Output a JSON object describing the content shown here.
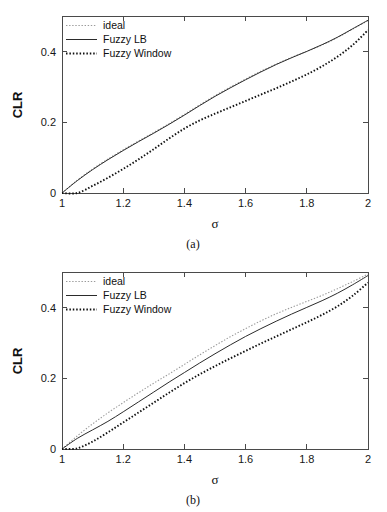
{
  "figure": {
    "panels": [
      {
        "id": "a",
        "caption": "(a)",
        "axes": {
          "xlabel": "σ",
          "ylabel": "CLR",
          "xticks": [
            "1",
            "1.2",
            "1.4",
            "1.6",
            "1.8",
            "2"
          ],
          "yticks": [
            "0",
            "0.2",
            "0.4"
          ],
          "xlim": [
            1,
            2
          ],
          "ylim": [
            0,
            0.5
          ]
        },
        "legend": {
          "position": "top-left",
          "entries": [
            {
              "label": "ideal",
              "style": "dotted-light",
              "color": "#9a9a9a"
            },
            {
              "label": "Fuzzy LB",
              "style": "solid",
              "color": "#2b2b2b"
            },
            {
              "label": "Fuzzy Window",
              "style": "dotted-bold",
              "color": "#111111"
            }
          ]
        }
      },
      {
        "id": "b",
        "caption": "(b)",
        "axes": {
          "xlabel": "σ",
          "ylabel": "CLR",
          "xticks": [
            "1",
            "1.2",
            "1.4",
            "1.6",
            "1.8",
            "2"
          ],
          "yticks": [
            "0",
            "0.2",
            "0.4"
          ],
          "xlim": [
            1,
            2
          ],
          "ylim": [
            0,
            0.5
          ]
        },
        "legend": {
          "position": "top-left",
          "entries": [
            {
              "label": "ideal",
              "style": "dotted-light",
              "color": "#9a9a9a"
            },
            {
              "label": "Fuzzy LB",
              "style": "solid",
              "color": "#2b2b2b"
            },
            {
              "label": "Fuzzy Window",
              "style": "dotted-bold",
              "color": "#111111"
            }
          ]
        }
      }
    ]
  },
  "chart_data": [
    {
      "type": "line",
      "title": "(a)",
      "xlabel": "σ",
      "ylabel": "CLR",
      "xlim": [
        1,
        2
      ],
      "ylim": [
        0,
        0.5
      ],
      "xticks": [
        1,
        1.2,
        1.4,
        1.6,
        1.8,
        2
      ],
      "yticks": [
        0,
        0.2,
        0.4
      ],
      "grid": false,
      "legend_position": "top-left",
      "x": [
        1.0,
        1.05,
        1.1,
        1.15,
        1.2,
        1.25,
        1.3,
        1.35,
        1.4,
        1.45,
        1.5,
        1.55,
        1.6,
        1.65,
        1.7,
        1.75,
        1.8,
        1.85,
        1.9,
        1.95,
        2.0
      ],
      "series": [
        {
          "name": "ideal",
          "values": [
            0.0,
            0.036,
            0.068,
            0.096,
            0.122,
            0.147,
            0.171,
            0.196,
            0.222,
            0.249,
            0.275,
            0.299,
            0.322,
            0.344,
            0.364,
            0.383,
            0.4,
            0.418,
            0.439,
            0.463,
            0.487
          ]
        },
        {
          "name": "Fuzzy LB",
          "values": [
            0.0,
            0.035,
            0.066,
            0.094,
            0.12,
            0.145,
            0.169,
            0.194,
            0.22,
            0.247,
            0.273,
            0.297,
            0.32,
            0.342,
            0.363,
            0.382,
            0.4,
            0.419,
            0.44,
            0.464,
            0.488
          ]
        },
        {
          "name": "Fuzzy Window",
          "values": [
            0.0,
            0.0,
            0.02,
            0.043,
            0.068,
            0.095,
            0.124,
            0.154,
            0.182,
            0.205,
            0.224,
            0.242,
            0.26,
            0.278,
            0.296,
            0.315,
            0.335,
            0.358,
            0.385,
            0.418,
            0.46
          ]
        }
      ]
    },
    {
      "type": "line",
      "title": "(b)",
      "xlabel": "σ",
      "ylabel": "CLR",
      "xlim": [
        1,
        2
      ],
      "ylim": [
        0,
        0.5
      ],
      "xticks": [
        1,
        1.2,
        1.4,
        1.6,
        1.8,
        2
      ],
      "yticks": [
        0,
        0.2,
        0.4
      ],
      "grid": false,
      "legend_position": "top-left",
      "x": [
        1.0,
        1.05,
        1.1,
        1.15,
        1.2,
        1.25,
        1.3,
        1.35,
        1.4,
        1.45,
        1.5,
        1.55,
        1.6,
        1.65,
        1.7,
        1.75,
        1.8,
        1.85,
        1.9,
        1.95,
        2.0
      ],
      "series": [
        {
          "name": "ideal",
          "values": [
            0.0,
            0.037,
            0.071,
            0.102,
            0.131,
            0.159,
            0.186,
            0.212,
            0.239,
            0.266,
            0.292,
            0.317,
            0.34,
            0.362,
            0.382,
            0.4,
            0.417,
            0.434,
            0.453,
            0.473,
            0.494
          ]
        },
        {
          "name": "Fuzzy LB",
          "values": [
            0.0,
            0.03,
            0.054,
            0.078,
            0.105,
            0.133,
            0.161,
            0.189,
            0.216,
            0.243,
            0.269,
            0.294,
            0.318,
            0.34,
            0.361,
            0.381,
            0.4,
            0.419,
            0.44,
            0.464,
            0.49
          ]
        },
        {
          "name": "Fuzzy Window",
          "values": [
            0.0,
            0.002,
            0.021,
            0.047,
            0.075,
            0.103,
            0.131,
            0.159,
            0.186,
            0.211,
            0.234,
            0.256,
            0.277,
            0.298,
            0.318,
            0.338,
            0.358,
            0.379,
            0.403,
            0.433,
            0.47
          ]
        }
      ]
    }
  ]
}
